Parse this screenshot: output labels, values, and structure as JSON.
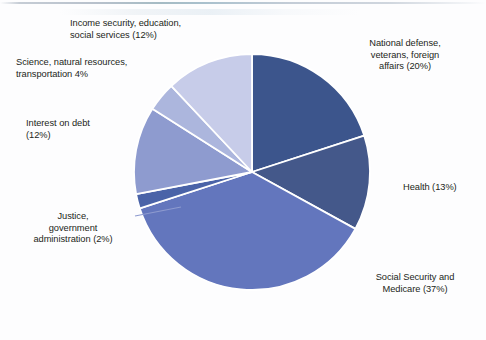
{
  "figure": {
    "title": "",
    "background_color": "#fdfdfe"
  },
  "chart_data": {
    "type": "pie",
    "title": "",
    "subtitle": "",
    "xlabel": "",
    "ylabel": "",
    "legend_position": "none",
    "grid": false,
    "start_angle_deg": 0,
    "direction": "clockwise",
    "categories": [
      "National defense, veterans, foreign affairs",
      "Health",
      "Social Security and Medicare",
      "Justice, government administration",
      "Interest on debt",
      "Science, natural resources, transportation",
      "Income security, education, social services"
    ],
    "values": [
      20,
      13,
      37,
      2,
      12,
      4,
      12
    ],
    "unit": "percent",
    "colors": [
      "#3c558c",
      "#44588a",
      "#6376bd",
      "#4a63a8",
      "#8e9bcf",
      "#acb6dd",
      "#c7cce9"
    ],
    "slice_separator_color": "#ffffff",
    "slices": [
      {
        "name": "National defense, veterans, foreign affairs",
        "value": 20,
        "label": "National defense,\nveterans, foreign\naffairs (20%)",
        "color": "#3c558c",
        "start_deg": 0,
        "end_deg": 72
      },
      {
        "name": "Health",
        "value": 13,
        "label": "Health (13%)",
        "color": "#44588a",
        "start_deg": 72,
        "end_deg": 118.8
      },
      {
        "name": "Social Security and Medicare",
        "value": 37,
        "label": "Social Security and\nMedicare (37%)",
        "color": "#6376bd",
        "start_deg": 118.8,
        "end_deg": 252
      },
      {
        "name": "Justice, government administration",
        "value": 2,
        "label": "Justice,\ngovernment\nadministration (2%)",
        "color": "#4a63a8",
        "start_deg": 252,
        "end_deg": 259.2
      },
      {
        "name": "Interest on debt",
        "value": 12,
        "label": "Interest on debt\n(12%)",
        "color": "#8e9bcf",
        "start_deg": 259.2,
        "end_deg": 302.4
      },
      {
        "name": "Science, natural resources, transportation",
        "value": 4,
        "label": "Science, natural resources,\ntransportation 4%",
        "color": "#acb6dd",
        "start_deg": 302.4,
        "end_deg": 316.8
      },
      {
        "name": "Income security, education, social services",
        "value": 12,
        "label": "Income security, education,\nsocial services (12%)",
        "color": "#c7cce9",
        "start_deg": 316.8,
        "end_deg": 360
      }
    ]
  },
  "geometry": {
    "center_x": 252,
    "center_y": 172,
    "radius": 118
  },
  "leader_line": {
    "name": "justice-leader-line",
    "color": "#8e9bcf",
    "x1": 135,
    "y1": 216,
    "x2": 181,
    "y2": 207
  }
}
